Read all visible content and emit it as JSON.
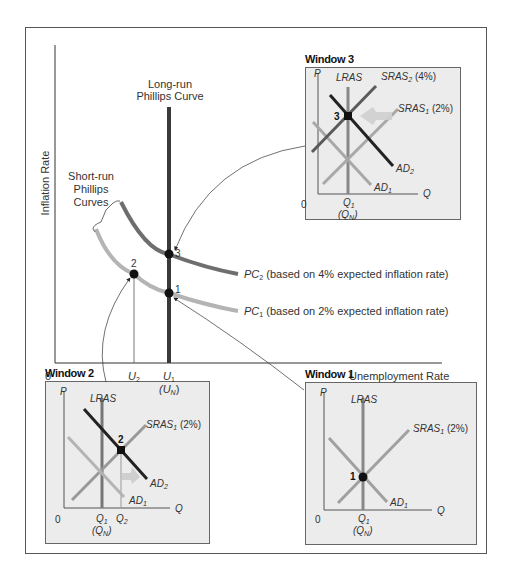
{
  "main_graph": {
    "y_axis_label": "Inflation Rate",
    "x_axis_label": "Unemployment Rate",
    "origin_label": "0",
    "lrpc_label_line1": "Long-run",
    "lrpc_label_line2": "Phillips Curve",
    "srpc_label_line1": "Short-run",
    "srpc_label_line2": "Phillips",
    "srpc_label_line3": "Curves",
    "pc2_name": "PC",
    "pc2_sub": "2",
    "pc2_desc": " (based on 4% expected inflation rate)",
    "pc1_name": "PC",
    "pc1_sub": "1",
    "pc1_desc": " (based on 2% expected inflation rate)",
    "u2_name": "U",
    "u2_sub": "2",
    "u1_name": "U",
    "u1_sub": "1",
    "un_open": "(U",
    "un_sub": "N",
    "un_close": ")",
    "points": [
      {
        "label": "1",
        "curve": "PC1",
        "at": "U1"
      },
      {
        "label": "2",
        "curve": "PC1",
        "at": "U2"
      },
      {
        "label": "3",
        "curve": "PC2",
        "at": "U1"
      }
    ],
    "colors": {
      "lrpc": "#3a3a3a",
      "pc2": "#6e6e6e",
      "pc1": "#b4b4b4",
      "window_bg": "#ececec"
    }
  },
  "window3": {
    "title": "Window 3",
    "p_label": "P",
    "q_label": "Q",
    "origin": "0",
    "lras": "LRAS",
    "sras2_name": "SRAS",
    "sras2_sub": "2",
    "sras2_pct": " (4%)",
    "sras1_name": "SRAS",
    "sras1_sub": "1",
    "sras1_pct": " (2%)",
    "ad2_name": "AD",
    "ad2_sub": "2",
    "ad1_name": "AD",
    "ad1_sub": "1",
    "q1_name": "Q",
    "q1_sub": "1",
    "qn_open": "(Q",
    "qn_sub": "N",
    "qn_close": ")",
    "point": "3"
  },
  "window2": {
    "title": "Window 2",
    "p_label": "P",
    "q_label": "Q",
    "origin": "0",
    "lras": "LRAS",
    "sras1_name": "SRAS",
    "sras1_sub": "1",
    "sras1_pct": " (2%)",
    "ad2_name": "AD",
    "ad2_sub": "2",
    "ad1_name": "AD",
    "ad1_sub": "1",
    "q1_name": "Q",
    "q1_sub": "1",
    "q2_name": "Q",
    "q2_sub": "2",
    "qn_open": "(Q",
    "qn_sub": "N",
    "qn_close": ")",
    "point": "2"
  },
  "window1": {
    "title": "Window 1",
    "p_label": "P",
    "q_label": "Q",
    "origin": "0",
    "lras": "LRAS",
    "sras1_name": "SRAS",
    "sras1_sub": "1",
    "sras1_pct": " (2%)",
    "ad1_name": "AD",
    "ad1_sub": "1",
    "q1_name": "Q",
    "q1_sub": "1",
    "qn_open": "(Q",
    "qn_sub": "N",
    "qn_close": ")",
    "point": "1"
  }
}
